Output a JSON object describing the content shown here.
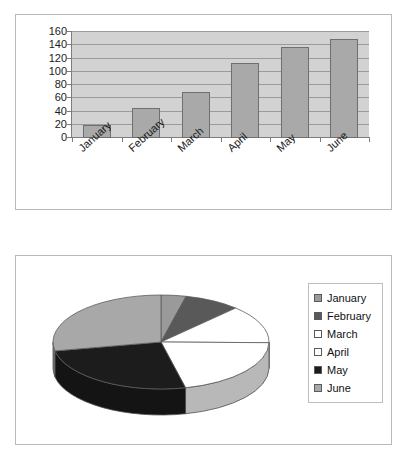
{
  "chart_data": [
    {
      "type": "bar",
      "title": "",
      "xlabel": "",
      "ylabel": "",
      "categories": [
        "January",
        "February",
        "March",
        "April",
        "May",
        "June"
      ],
      "values": [
        20,
        45,
        70,
        113,
        137,
        150
      ],
      "series": [
        {
          "name": "Series 1",
          "values": [
            20,
            45,
            70,
            113,
            137,
            150
          ]
        }
      ],
      "ylim": [
        0,
        160
      ],
      "yticks": [
        0,
        20,
        40,
        60,
        80,
        100,
        120,
        140,
        160
      ],
      "ytick_labels": [
        "0",
        "20",
        "40",
        "60",
        "80",
        "100",
        "120",
        "140",
        "160"
      ],
      "grid": true,
      "grid_axis": "y",
      "legend": false,
      "bar_color": "#a9a9a9",
      "plot_background": "#d2d2d2",
      "xlabel_rotation": -42
    },
    {
      "type": "pie",
      "title": "",
      "effect": "3d",
      "start_angle_deg": 0,
      "direction": "clockwise",
      "labels": [
        "January",
        "February",
        "March",
        "April",
        "May",
        "June"
      ],
      "values": [
        20,
        45,
        70,
        113,
        137,
        150
      ],
      "percentages": [
        3.7,
        8.4,
        13.0,
        21.0,
        25.5,
        27.9
      ],
      "colors": [
        "#9a9a9a",
        "#595959",
        "#ffffff",
        "#ffffff",
        "#1c1c1c",
        "#a8a8a8"
      ],
      "legend": true,
      "legend_position": "right",
      "legend_entries": [
        {
          "label": "January",
          "color": "#9a9a9a"
        },
        {
          "label": "February",
          "color": "#595959"
        },
        {
          "label": "March",
          "color": "#ffffff"
        },
        {
          "label": "April",
          "color": "#ffffff"
        },
        {
          "label": "May",
          "color": "#1c1c1c"
        },
        {
          "label": "June",
          "color": "#a8a8a8"
        }
      ]
    }
  ],
  "bar_chart": {
    "ytick_labels": [
      "160",
      "140",
      "120",
      "100",
      "80",
      "60",
      "40",
      "20",
      "0"
    ],
    "xtick_labels": [
      "January",
      "February",
      "March",
      "April",
      "May",
      "June"
    ]
  },
  "pie_chart": {
    "legend": {
      "items": [
        {
          "label": "January"
        },
        {
          "label": "February"
        },
        {
          "label": "March"
        },
        {
          "label": "April"
        },
        {
          "label": "May"
        },
        {
          "label": "June"
        }
      ]
    }
  }
}
